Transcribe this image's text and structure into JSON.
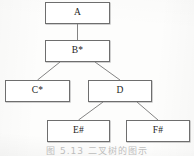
{
  "figure": {
    "kind": "hierarchy-tree-diagram",
    "caption": "图 5.13   二叉树的图示",
    "caption_note": "clipped at bottom edge of scan",
    "ink_color": "#6e6e6e",
    "text_color": "#1d1d1d",
    "paper_color": "#fdfdfc"
  },
  "nodes": [
    {
      "id": "A",
      "label": "A",
      "x": 45,
      "y": 2,
      "w": 65,
      "h": 22,
      "level": 0
    },
    {
      "id": "B",
      "label": "B*",
      "x": 45,
      "y": 40,
      "w": 65,
      "h": 22,
      "level": 1
    },
    {
      "id": "C",
      "label": "C*",
      "x": 5,
      "y": 80,
      "w": 65,
      "h": 22,
      "level": 2
    },
    {
      "id": "D",
      "label": "D",
      "x": 88,
      "y": 80,
      "w": 64,
      "h": 22,
      "level": 2
    },
    {
      "id": "E",
      "label": "E#",
      "x": 47,
      "y": 120,
      "w": 63,
      "h": 22,
      "level": 3
    },
    {
      "id": "F",
      "label": "F#",
      "x": 126,
      "y": 120,
      "w": 64,
      "h": 22,
      "level": 3
    }
  ],
  "edges": [
    {
      "from": "A",
      "to": "C",
      "x1": 77.5,
      "y1": 24,
      "x2": 77.5,
      "y2": 40,
      "style": "vertical"
    },
    {
      "from": "B",
      "to": "C",
      "x1": 60,
      "y1": 62,
      "x2": 37.5,
      "y2": 80,
      "style": "diagonal"
    },
    {
      "from": "B",
      "to": "D",
      "x1": 95,
      "y1": 62,
      "x2": 120,
      "y2": 80,
      "style": "diagonal"
    },
    {
      "from": "D",
      "to": "E",
      "x1": 103,
      "y1": 102,
      "x2": 78.5,
      "y2": 120,
      "style": "diagonal"
    },
    {
      "from": "D",
      "to": "F",
      "x1": 137,
      "y1": 102,
      "x2": 158,
      "y2": 120,
      "style": "diagonal"
    }
  ]
}
